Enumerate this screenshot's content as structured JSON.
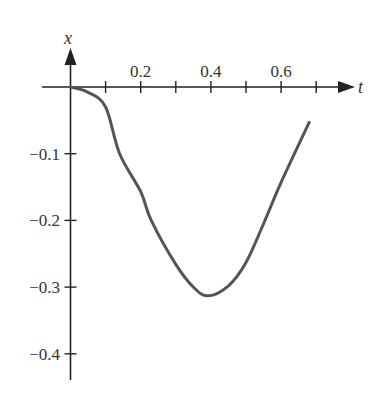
{
  "chart_data": {
    "type": "line",
    "title": "",
    "xlabel": "t",
    "ylabel": "x",
    "xlim": [
      0,
      0.8
    ],
    "ylim": [
      -0.43,
      0.05
    ],
    "grid": false,
    "legend": null,
    "x_tick_labels": [
      "0.2",
      "0.4",
      "0.6"
    ],
    "x_ticks": [
      0.1,
      0.2,
      0.3,
      0.4,
      0.5,
      0.6,
      0.7
    ],
    "y_tick_labels": [
      "−0.1",
      "−0.2",
      "−0.3",
      "−0.4"
    ],
    "y_ticks": [
      -0.1,
      -0.2,
      -0.3,
      -0.4
    ],
    "series": [
      {
        "name": "x(t)",
        "color": "#555555",
        "x": [
          0,
          0.05,
          0.1,
          0.14,
          0.2,
          0.23,
          0.3,
          0.35,
          0.392,
          0.45,
          0.5,
          0.55,
          0.6,
          0.68
        ],
        "values": [
          0,
          -0.008,
          -0.03,
          -0.1,
          -0.157,
          -0.2,
          -0.266,
          -0.3,
          -0.313,
          -0.298,
          -0.263,
          -0.205,
          -0.143,
          -0.053
        ]
      }
    ]
  },
  "labels": {
    "x_axis": "t",
    "y_axis": "x"
  },
  "colors": {
    "axis": "#222222",
    "curve": "#555555",
    "text": "#333333"
  }
}
